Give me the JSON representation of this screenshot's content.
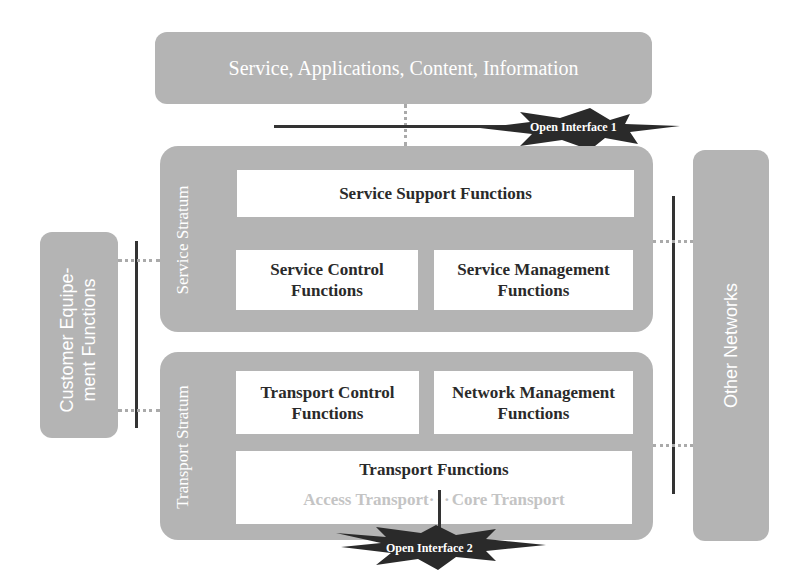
{
  "top": {
    "label": "Service, Applications, Content, Information"
  },
  "service_stratum": {
    "label": "Service Stratum",
    "support": "Service Support Functions",
    "control_l1": "Service Control",
    "control_l2": "Functions",
    "mgmt_l1": "Service Management",
    "mgmt_l2": "Functions"
  },
  "transport_stratum": {
    "label": "Transport Stratum",
    "control_l1": "Transport Control",
    "control_l2": "Functions",
    "mgmt_l1": "Network Management",
    "mgmt_l2": "Functions",
    "transport": "Transport Functions",
    "access": "Access Transport",
    "core": "Core Transport"
  },
  "customer": {
    "l1": "Customer Equipe-",
    "l2": "ment Functions"
  },
  "other": {
    "label": "Other Networks"
  },
  "interfaces": {
    "oi1": "Open Interface 1",
    "oi2": "Open Interface 2"
  }
}
